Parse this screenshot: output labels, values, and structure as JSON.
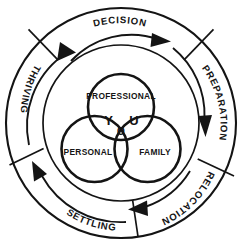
{
  "diagram": {
    "colors": {
      "stroke": "#141414",
      "background": "#ffffff"
    },
    "outer_ring": {
      "name": "relocation-cycle-ring",
      "direction": "clockwise",
      "segments": [
        {
          "id": "decision",
          "label": "DECISION",
          "position": "top"
        },
        {
          "id": "preparation",
          "label": "PREPARATION",
          "position": "upper-right"
        },
        {
          "id": "relocation",
          "label": "RELOCATION",
          "position": "lower-right"
        },
        {
          "id": "settling",
          "label": "SETTLING",
          "position": "bottom-left"
        },
        {
          "id": "thriving",
          "label": "THRIVING",
          "position": "upper-left"
        }
      ]
    },
    "venn": {
      "name": "you-venn-diagram",
      "circles": [
        {
          "id": "professional",
          "label": "PROFESSIONAL",
          "position": "top"
        },
        {
          "id": "personal",
          "label": "PERSONAL",
          "position": "bottom-left"
        },
        {
          "id": "family",
          "label": "FAMILY",
          "position": "bottom-right"
        }
      ],
      "overlap_letters": [
        {
          "id": "letter-y",
          "label": "Y",
          "region": "professional-personal"
        },
        {
          "id": "letter-o",
          "label": "O",
          "region": "all-three"
        },
        {
          "id": "letter-u",
          "label": "U",
          "region": "professional-family"
        }
      ],
      "word": "YOU"
    }
  }
}
